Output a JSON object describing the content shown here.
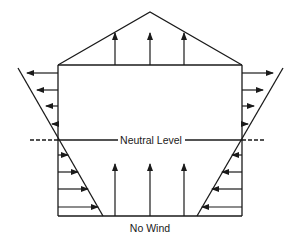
{
  "diagram": {
    "labels": {
      "neutral_level": "Neutral Level",
      "no_wind": "No Wind"
    },
    "colors": {
      "line": "#1a1a1a",
      "background": "#ffffff"
    },
    "building": {
      "left_wall_x": 58,
      "right_wall_x": 242,
      "ceiling_y": 65,
      "floor_y": 216,
      "roof_peak": [
        150,
        12
      ]
    },
    "neutral_level_y": 140,
    "pressure_profiles": {
      "left_outer_line": [
        [
          18,
          68
        ],
        [
          103,
          216
        ]
      ],
      "right_outer_line": [
        [
          283,
          68
        ],
        [
          197,
          216
        ]
      ],
      "left_upper_arrows": [
        {
          "y": 73,
          "to_x": 27
        },
        {
          "y": 90,
          "to_x": 37
        },
        {
          "y": 106,
          "to_x": 46
        },
        {
          "y": 124,
          "to_x": 55
        }
      ],
      "left_lower_arrows": [
        {
          "y": 155,
          "to_x": 67
        },
        {
          "y": 172,
          "to_x": 78
        },
        {
          "y": 189,
          "to_x": 87
        },
        {
          "y": 207,
          "to_x": 98
        }
      ],
      "right_upper_arrows": [
        {
          "y": 73,
          "to_x": 273
        },
        {
          "y": 90,
          "to_x": 263
        },
        {
          "y": 106,
          "to_x": 254
        },
        {
          "y": 124,
          "to_x": 245
        }
      ],
      "right_lower_arrows": [
        {
          "y": 155,
          "to_x": 233
        },
        {
          "y": 172,
          "to_x": 222
        },
        {
          "y": 189,
          "to_x": 213
        },
        {
          "y": 207,
          "to_x": 202
        }
      ]
    },
    "roof_arrows": [
      {
        "x": 115,
        "top": 33
      },
      {
        "x": 150,
        "top": 33
      },
      {
        "x": 184,
        "top": 33
      }
    ],
    "floor_arrows": [
      {
        "x": 115,
        "top": 164
      },
      {
        "x": 150,
        "top": 164
      },
      {
        "x": 184,
        "top": 164
      }
    ]
  }
}
